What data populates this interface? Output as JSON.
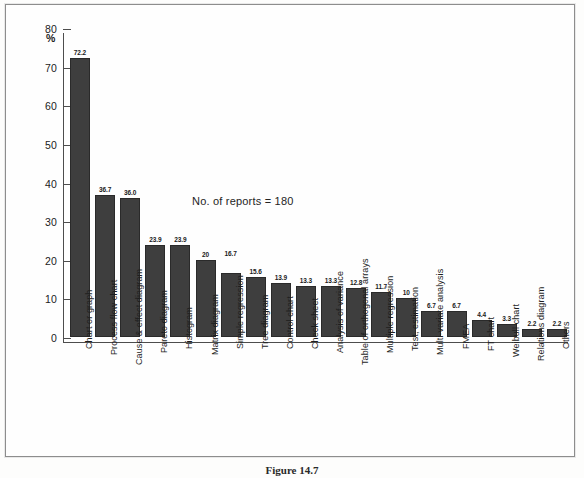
{
  "figure": {
    "caption": "Figure 14.7",
    "annotation": "No. of reports = 180",
    "axis_unit_label": "%"
  },
  "chart_data": {
    "type": "bar",
    "title": "",
    "subtitle": "",
    "xlabel": "",
    "ylabel": "%",
    "ylim": [
      0,
      80
    ],
    "ytick_step": 10,
    "ytick_labels": [
      "0",
      "10",
      "20",
      "30",
      "40",
      "50",
      "60",
      "70",
      "80"
    ],
    "grid": false,
    "legend": "none",
    "annotations": [
      "No. of reports = 180"
    ],
    "bar_color": "#3e3e3e",
    "categories": [
      "Chart or graph",
      "Process flow chart",
      "Cause & effect diagram",
      "Pareto diagram",
      "Histogram",
      "Matrix diagram",
      "Simple regression",
      "Tree diagram",
      "Control chart",
      "Check sheet",
      "Analysis of variance",
      "Table of orthogonal arrays",
      "Multiple regression",
      "Test, estimation",
      "Multi-variate analysis",
      "FMEA",
      "FT chart",
      "Weibull chart",
      "Relations diagram",
      "Others"
    ],
    "values": [
      72.2,
      36.7,
      36.0,
      23.9,
      23.9,
      20,
      16.7,
      15.6,
      13.9,
      13.3,
      13.3,
      12.8,
      11.7,
      10,
      6.7,
      6.7,
      4.4,
      3.3,
      2.2,
      2.2
    ],
    "value_labels": [
      "72.2",
      "36.7",
      "36.0",
      "23.9",
      "23.9",
      "20",
      "16.7",
      "15.6",
      "13.9",
      "13.3",
      "13.3",
      "12.8",
      "11.7",
      "10",
      "6.7",
      "6.7",
      "4.4",
      "3.3",
      "2.2",
      "2.2"
    ],
    "label_offsets": [
      0,
      0,
      0,
      0,
      0,
      0,
      14,
      0,
      0,
      0,
      0,
      0,
      0,
      0,
      0,
      0,
      0,
      0,
      0,
      0
    ]
  }
}
